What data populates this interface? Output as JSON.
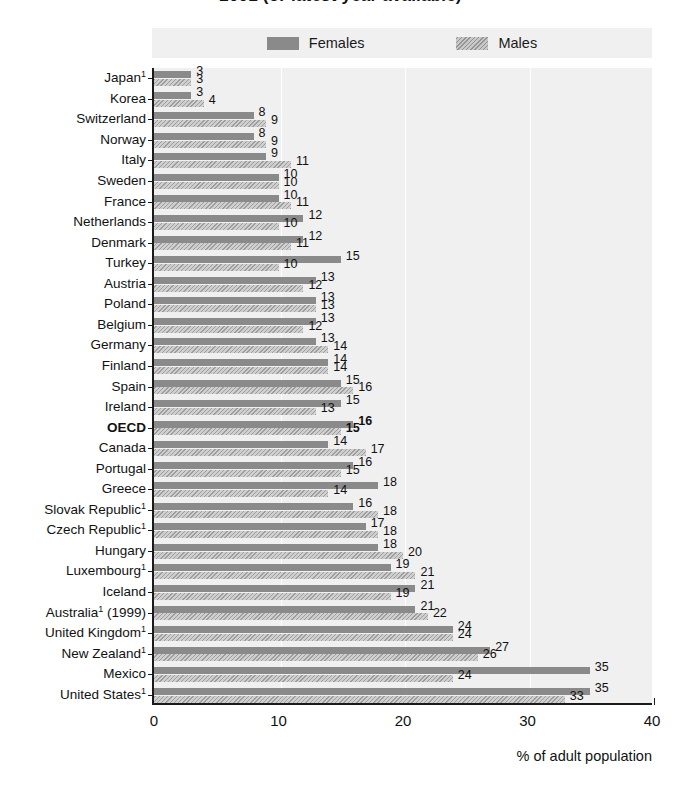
{
  "title": "2001 (or latest year available)",
  "legend": {
    "position": "top",
    "items": [
      {
        "label": "Females",
        "swatch": "female-swatch",
        "color": "#8a8a8a"
      },
      {
        "label": "Males",
        "swatch": "male-swatch",
        "color": "#c8c8c8"
      }
    ]
  },
  "axis": {
    "x_title": "% of adult population",
    "x_ticks": [
      "0",
      "10",
      "20",
      "30",
      "40"
    ]
  },
  "chart_data": {
    "type": "bar",
    "orientation": "horizontal",
    "title": "2001 (or latest year available)",
    "xlabel": "% of adult population",
    "ylabel": "",
    "xlim": [
      0,
      40
    ],
    "grid": true,
    "legend_position": "top",
    "categories": [
      "Japan¹",
      "Korea",
      "Switzerland",
      "Norway",
      "Italy",
      "Sweden",
      "France",
      "Netherlands",
      "Denmark",
      "Turkey",
      "Austria",
      "Poland",
      "Belgium",
      "Germany",
      "Finland",
      "Spain",
      "Ireland",
      "OECD",
      "Canada",
      "Portugal",
      "Greece",
      "Slovak Republic¹",
      "Czech Republic¹",
      "Hungary",
      "Luxembourg¹",
      "Iceland",
      "Australia¹ (1999)",
      "United Kingdom¹",
      "New Zealand¹",
      "Mexico",
      "United States¹"
    ],
    "highlight_category": "OECD",
    "series": [
      {
        "name": "Females",
        "color": "#8a8a8a",
        "values": [
          3,
          3,
          8,
          8,
          9,
          10,
          10,
          12,
          12,
          15,
          13,
          13,
          13,
          13,
          14,
          15,
          15,
          16,
          14,
          16,
          18,
          16,
          17,
          18,
          19,
          21,
          21,
          24,
          27,
          35,
          35
        ]
      },
      {
        "name": "Males",
        "color": "#c8c8c8",
        "values": [
          3,
          4,
          9,
          9,
          11,
          10,
          11,
          10,
          11,
          10,
          12,
          13,
          12,
          14,
          14,
          16,
          13,
          15,
          17,
          15,
          14,
          18,
          18,
          20,
          21,
          19,
          22,
          24,
          26,
          24,
          33
        ]
      }
    ]
  }
}
